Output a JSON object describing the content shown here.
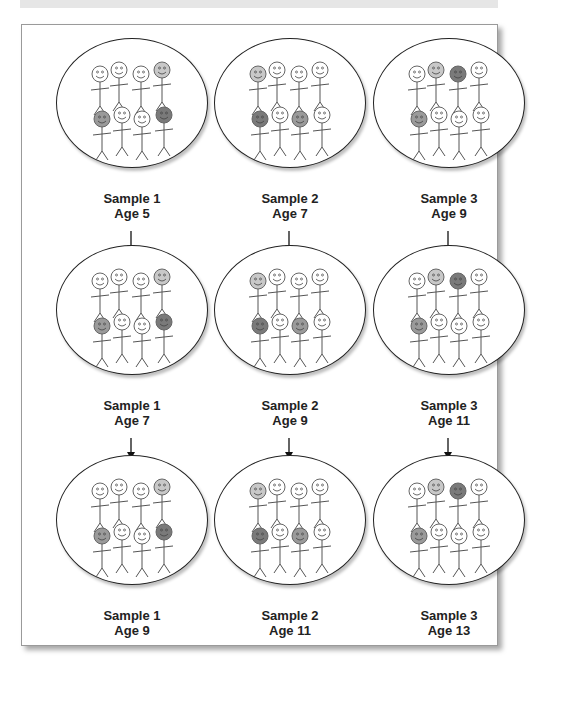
{
  "diagram": {
    "type": "longitudinal-cohort-samples",
    "face_colors": {
      "white": "#ffffff",
      "light": "#c8c8c8",
      "mid": "#9a9a9a",
      "dark": "#7a7a7a"
    },
    "columns": [
      {
        "sample": "Sample 1",
        "faces": [
          "white",
          "white",
          "white",
          "light",
          "mid",
          "white",
          "white",
          "dark"
        ],
        "stages": [
          {
            "sample_label": "Sample 1",
            "age_label": "Age 5"
          },
          {
            "sample_label": "Sample 1",
            "age_label": "Age 7"
          },
          {
            "sample_label": "Sample 1",
            "age_label": "Age 9"
          }
        ]
      },
      {
        "sample": "Sample 2",
        "faces": [
          "light",
          "white",
          "white",
          "white",
          "dark",
          "white",
          "mid",
          "white"
        ],
        "stages": [
          {
            "sample_label": "Sample 2",
            "age_label": "Age 7"
          },
          {
            "sample_label": "Sample 2",
            "age_label": "Age 9"
          },
          {
            "sample_label": "Sample 2",
            "age_label": "Age 11"
          }
        ]
      },
      {
        "sample": "Sample 3",
        "faces": [
          "white",
          "light",
          "dark",
          "white",
          "mid",
          "white",
          "white",
          "white"
        ],
        "stages": [
          {
            "sample_label": "Sample 3",
            "age_label": "Age 9"
          },
          {
            "sample_label": "Sample 3",
            "age_label": "Age 11"
          },
          {
            "sample_label": "Sample 3",
            "age_label": "Age 13"
          }
        ]
      }
    ]
  }
}
